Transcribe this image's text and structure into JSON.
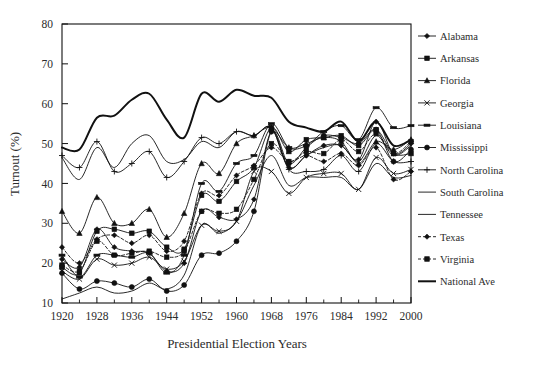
{
  "chart_data": {
    "type": "line",
    "title": "",
    "xlabel": "Presidential Election Years",
    "ylabel": "Turnout (%)",
    "xlim": [
      1920,
      2000
    ],
    "ylim": [
      10,
      80
    ],
    "ytick_step": 10,
    "xtick_step": 8,
    "xtick_minor_step": 4,
    "grid": false,
    "legend_position": "right",
    "yticks": [
      10,
      20,
      30,
      40,
      50,
      60,
      70,
      80
    ],
    "xticks": [
      1920,
      1928,
      1936,
      1944,
      1952,
      1960,
      1968,
      1976,
      1984,
      1992,
      2000
    ],
    "x": [
      1920,
      1924,
      1928,
      1932,
      1936,
      1940,
      1944,
      1948,
      1952,
      1956,
      1960,
      1964,
      1968,
      1972,
      1976,
      1980,
      1984,
      1988,
      1992,
      1996,
      2000
    ],
    "series": [
      {
        "name": "Alabama",
        "marker": "diamond",
        "dash": "solid",
        "width": 0.9,
        "values": [
          21.0,
          19.0,
          28.5,
          24.0,
          23.0,
          22.5,
          18.0,
          20.0,
          33.0,
          31.5,
          31.0,
          36.0,
          53.0,
          44.0,
          47.0,
          49.5,
          49.5,
          46.0,
          55.5,
          47.5,
          50.0
        ]
      },
      {
        "name": "Arkansas",
        "marker": "square",
        "dash": "solid",
        "width": 0.9,
        "values": [
          19.0,
          17.5,
          28.0,
          28.5,
          27.5,
          28.0,
          24.0,
          23.5,
          37.0,
          35.5,
          40.5,
          44.0,
          54.0,
          48.0,
          51.0,
          51.5,
          52.0,
          49.5,
          53.5,
          47.5,
          47.5
        ]
      },
      {
        "name": "Florida",
        "marker": "triangle",
        "dash": "solid",
        "width": 0.9,
        "values": [
          33.0,
          27.5,
          36.5,
          30.0,
          30.0,
          33.5,
          26.5,
          32.5,
          45.0,
          42.5,
          50.0,
          52.0,
          54.0,
          49.0,
          50.0,
          51.5,
          50.5,
          45.0,
          50.5,
          48.5,
          51.0
        ]
      },
      {
        "name": "Georgia",
        "marker": "cross-x",
        "dash": "solid",
        "width": 0.9,
        "values": [
          18.0,
          16.0,
          21.0,
          19.5,
          20.0,
          21.5,
          18.5,
          20.5,
          29.5,
          28.0,
          30.5,
          43.0,
          43.0,
          37.5,
          41.5,
          42.5,
          42.5,
          38.5,
          46.5,
          42.5,
          43.5
        ]
      },
      {
        "name": "Louisiana",
        "marker": "dash-rect",
        "dash": "solid",
        "width": 0.9,
        "values": [
          22.0,
          16.5,
          22.0,
          22.0,
          21.5,
          22.5,
          17.5,
          22.0,
          40.0,
          38.0,
          45.0,
          47.0,
          55.0,
          49.0,
          49.5,
          53.0,
          54.5,
          51.0,
          59.0,
          54.0,
          54.5
        ]
      },
      {
        "name": "Mississippi",
        "marker": "circle",
        "dash": "solid",
        "width": 0.9,
        "values": [
          17.5,
          13.5,
          15.5,
          15.0,
          14.0,
          16.0,
          13.0,
          14.5,
          22.0,
          22.5,
          25.5,
          33.0,
          53.0,
          45.0,
          49.0,
          52.0,
          51.5,
          50.0,
          53.5,
          45.5,
          48.5
        ]
      },
      {
        "name": "North Carolina",
        "marker": "plus",
        "dash": "solid",
        "width": 0.9,
        "values": [
          47.0,
          44.0,
          50.5,
          43.0,
          45.0,
          48.0,
          41.5,
          45.5,
          51.5,
          50.0,
          53.0,
          52.0,
          54.0,
          43.5,
          43.0,
          43.5,
          47.0,
          43.0,
          50.0,
          45.5,
          45.5
        ]
      },
      {
        "name": "South Carolina",
        "marker": "none",
        "dash": "solid",
        "width": 0.9,
        "values": [
          11.0,
          12.5,
          14.0,
          12.5,
          13.0,
          15.0,
          13.5,
          17.0,
          29.5,
          27.5,
          30.5,
          39.5,
          47.0,
          39.5,
          41.5,
          41.5,
          41.5,
          38.5,
          45.0,
          41.5,
          42.0
        ]
      },
      {
        "name": "Tennessee",
        "marker": "none",
        "dash": "solid",
        "width": 0.9,
        "values": [
          46.5,
          41.0,
          49.0,
          44.0,
          50.0,
          52.0,
          45.5,
          46.0,
          50.5,
          49.0,
          53.0,
          52.0,
          54.0,
          44.0,
          47.0,
          49.0,
          49.5,
          45.5,
          52.0,
          47.0,
          49.5
        ]
      },
      {
        "name": "Texas",
        "marker": "diamond",
        "dash": "dashed",
        "width": 0.9,
        "values": [
          24.0,
          20.0,
          26.0,
          27.0,
          25.0,
          27.0,
          23.0,
          25.5,
          37.5,
          37.0,
          42.0,
          44.5,
          49.0,
          45.5,
          47.0,
          45.5,
          47.5,
          44.5,
          49.0,
          41.0,
          43.0
        ]
      },
      {
        "name": "Virginia",
        "marker": "square",
        "dash": "dashed",
        "width": 0.9,
        "values": [
          19.5,
          18.0,
          25.5,
          22.0,
          22.5,
          23.0,
          21.5,
          23.0,
          33.0,
          32.5,
          33.5,
          41.0,
          50.0,
          45.5,
          48.0,
          47.5,
          51.0,
          48.0,
          52.5,
          47.5,
          50.5
        ]
      },
      {
        "name": "National Ave",
        "marker": "none",
        "dash": "solid",
        "width": 2.0,
        "values": [
          49.0,
          48.5,
          56.5,
          57.0,
          61.0,
          62.5,
          56.0,
          51.5,
          62.5,
          60.5,
          63.5,
          62.0,
          61.5,
          55.5,
          54.0,
          53.0,
          55.5,
          50.5,
          55.5,
          49.5,
          51.0
        ]
      }
    ]
  },
  "figure": {
    "width": 545,
    "height": 371,
    "plot": {
      "left": 62,
      "top": 24,
      "right": 411,
      "bottom": 303
    },
    "legend": {
      "x": 418,
      "y": 36,
      "row_height": 22.3,
      "marker_line": 18
    }
  },
  "colors": {
    "ink": "#111111",
    "text": "#2b2b2b",
    "background": "#ffffff"
  }
}
